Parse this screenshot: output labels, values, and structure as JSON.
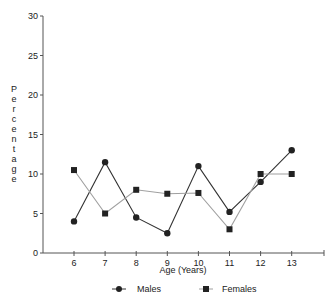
{
  "chart_data": {
    "type": "line",
    "title": "",
    "xlabel": "Age (Years)",
    "ylabel": "Percentage",
    "x": [
      6,
      7,
      8,
      9,
      10,
      11,
      12,
      13
    ],
    "categories": [
      "6",
      "7",
      "8",
      "9",
      "10",
      "11",
      "12",
      "13"
    ],
    "ylim": [
      0,
      30
    ],
    "yticks": [
      0,
      5,
      10,
      15,
      20,
      25,
      30
    ],
    "grid": false,
    "legend_position": "bottom",
    "series": [
      {
        "name": "Males",
        "marker": "circle",
        "color": "#333333",
        "values": [
          4,
          11.5,
          4.5,
          2.5,
          11,
          5.2,
          9,
          13
        ]
      },
      {
        "name": "Females",
        "marker": "square",
        "color": "#a0a0a0",
        "values": [
          10.5,
          5,
          8,
          7.5,
          7.6,
          3,
          10,
          10
        ]
      }
    ]
  },
  "legend": {
    "males": "Males",
    "females": "Females"
  }
}
